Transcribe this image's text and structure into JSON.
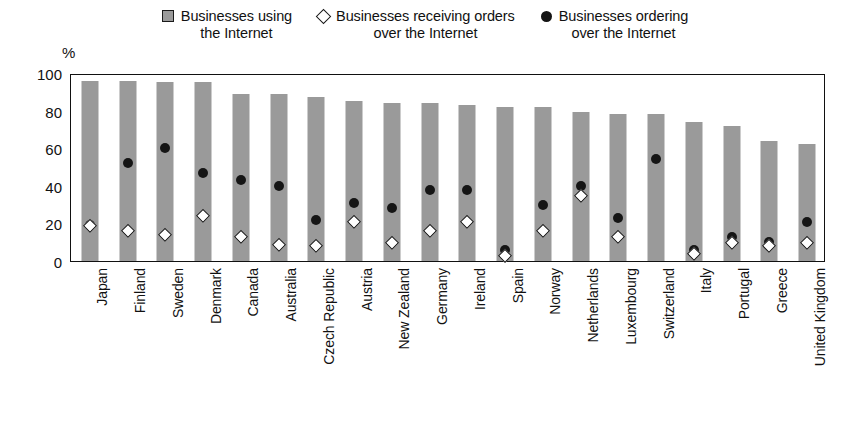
{
  "legend": {
    "position": "top-center",
    "entries": [
      {
        "marker": "square-icon",
        "color": "#9a9a9a",
        "label": "Businesses using\nthe Internet"
      },
      {
        "marker": "diamond-icon",
        "color": "#ffffff",
        "label": "Businesses receiving orders\nover the Internet"
      },
      {
        "marker": "circle-icon",
        "color": "#141414",
        "label": "Businesses ordering\nover the Internet"
      }
    ]
  },
  "axes": {
    "ylabel": "%",
    "yticks": [
      100,
      80,
      60,
      40,
      20,
      0
    ],
    "ylim": [
      0,
      100
    ]
  },
  "chart_data": {
    "type": "bar",
    "title": "",
    "xlabel": "",
    "ylabel": "%",
    "ylim": [
      0,
      100
    ],
    "grid": false,
    "legend_position": "top-center",
    "categories": [
      "Japan",
      "Finland",
      "Sweden",
      "Denmark",
      "Canada",
      "Australia",
      "Czech Republic",
      "Austria",
      "New Zealand",
      "Germany",
      "Ireland",
      "Spain",
      "Norway",
      "Netherlands",
      "Luxembourg",
      "Switzerland",
      "Italy",
      "Portugal",
      "Greece",
      "United Kingdom"
    ],
    "series": [
      {
        "name": "Businesses using the Internet",
        "marker": "bar",
        "values": [
          96,
          96,
          95,
          95,
          89,
          89,
          87,
          85,
          84,
          84,
          83,
          82,
          82,
          79,
          78,
          78,
          74,
          72,
          64,
          62
        ]
      },
      {
        "name": "Businesses receiving orders over the Internet",
        "marker": "diamond",
        "values": [
          19,
          16,
          14,
          24,
          13,
          9,
          8,
          21,
          10,
          16,
          21,
          3,
          16,
          35,
          13,
          null,
          4,
          10,
          8,
          10
        ]
      },
      {
        "name": "Businesses ordering over the Internet",
        "marker": "circle",
        "values": [
          19,
          52,
          60,
          47,
          43,
          40,
          22,
          31,
          28,
          38,
          38,
          6,
          30,
          40,
          23,
          54,
          6,
          13,
          10,
          21
        ]
      }
    ]
  },
  "colors": {
    "bar": "#9a9a9a",
    "marker_dark": "#141414",
    "marker_light": "#ffffff",
    "axis": "#111111"
  }
}
